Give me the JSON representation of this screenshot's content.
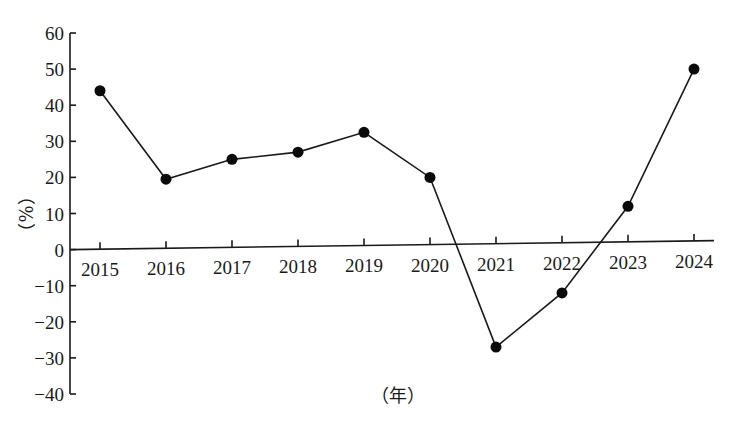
{
  "chart_data": {
    "type": "line",
    "title": "",
    "xlabel": "（年）",
    "ylabel": "（%）",
    "categories": [
      "2015",
      "2016",
      "2017",
      "2018",
      "2019",
      "2020",
      "2021",
      "2022",
      "2023",
      "2024"
    ],
    "series": [
      {
        "name": "growth_rate",
        "values": [
          44,
          19.5,
          25,
          27,
          32.5,
          20,
          -27,
          -12,
          12,
          50
        ],
        "color": "#1a1a1a",
        "marker": "filled-circle"
      }
    ],
    "yticks": [
      60,
      50,
      40,
      30,
      20,
      10,
      0,
      -10,
      -20,
      -30,
      -40
    ],
    "ylim": [
      -40,
      60
    ],
    "grid": false,
    "legend": null
  },
  "labels": {
    "y_axis_title": "（%）",
    "x_axis_title": "（年）"
  },
  "colors": {
    "line": "#1a1a1a",
    "marker": "#0a0a0a",
    "background": "#ffffff"
  }
}
